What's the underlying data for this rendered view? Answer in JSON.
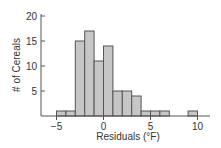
{
  "chart_data": {
    "type": "bar",
    "subtype": "histogram",
    "title": "",
    "xlabel": "Residuals (°F)",
    "ylabel": "# of Cereals",
    "bin_width": 1,
    "bins": [
      {
        "start": -5,
        "end": -4,
        "count": 1
      },
      {
        "start": -4,
        "end": -3,
        "count": 1
      },
      {
        "start": -3,
        "end": -2,
        "count": 15
      },
      {
        "start": -2,
        "end": -1,
        "count": 17
      },
      {
        "start": -1,
        "end": 0,
        "count": 11
      },
      {
        "start": 0,
        "end": 1,
        "count": 14
      },
      {
        "start": 1,
        "end": 2,
        "count": 5
      },
      {
        "start": 2,
        "end": 3,
        "count": 5
      },
      {
        "start": 3,
        "end": 4,
        "count": 4
      },
      {
        "start": 4,
        "end": 5,
        "count": 1
      },
      {
        "start": 5,
        "end": 6,
        "count": 1
      },
      {
        "start": 6,
        "end": 7,
        "count": 1
      },
      {
        "start": 7,
        "end": 8,
        "count": 0
      },
      {
        "start": 8,
        "end": 9,
        "count": 0
      },
      {
        "start": 9,
        "end": 10,
        "count": 1
      }
    ],
    "x_ticks": [
      -5,
      0,
      5,
      10
    ],
    "y_ticks": [
      5,
      10,
      15,
      20
    ],
    "xlim": [
      -6.6,
      11.4
    ],
    "ylim": [
      0,
      20
    ],
    "grid": false,
    "legend": null
  },
  "colors": {
    "bar_fill": "#c6c6c6",
    "bar_stroke": "#555555",
    "axis": "#555555",
    "text": "#333333"
  }
}
